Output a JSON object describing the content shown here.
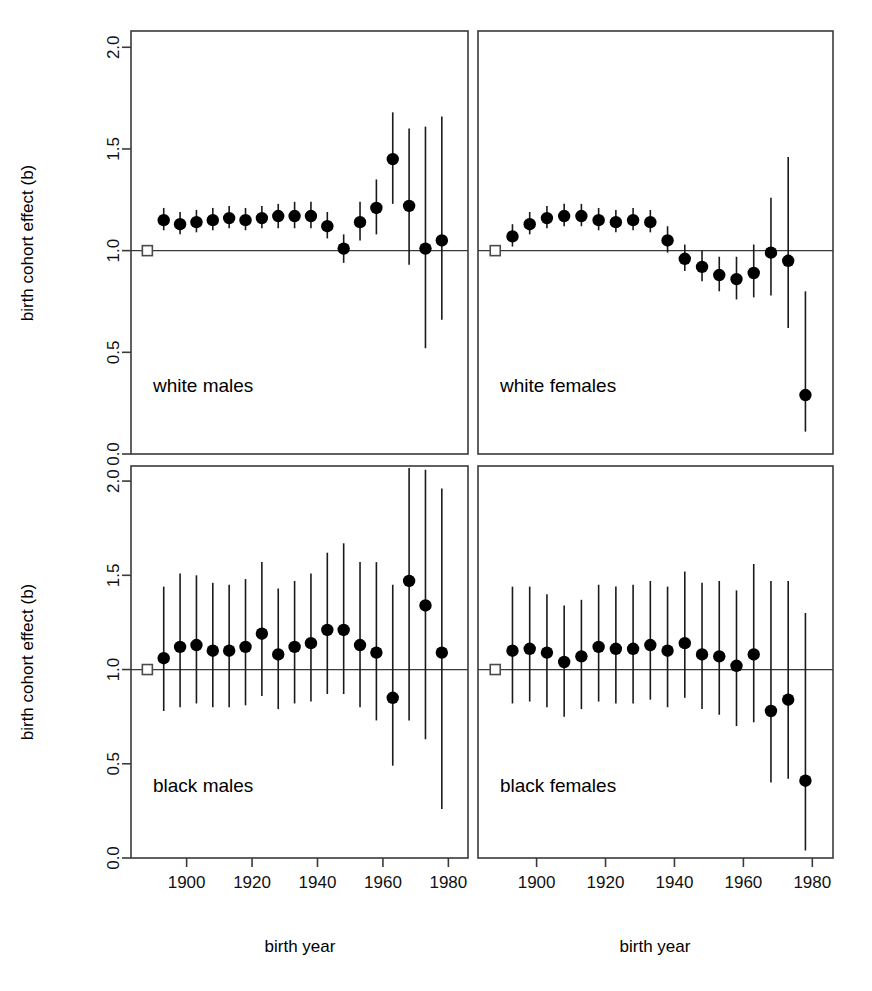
{
  "figure": {
    "title": "",
    "x_axis_label": "birth year",
    "y_axis_label": "birth cohort effect (b)",
    "y_ticks": [
      "0.0",
      "0.5",
      "1.0",
      "1.5",
      "2.0"
    ],
    "x_ticks": [
      "1900",
      "1920",
      "1940",
      "1960",
      "1980"
    ],
    "reference_value": "1.0",
    "reference_marker": "open-square",
    "point_marker": "filled-circle",
    "interval_marker": "vertical-error-bar"
  },
  "chart_data": {
    "type": "scatter",
    "title": "",
    "xlabel": "birth year",
    "ylabel": "birth cohort effect (b)",
    "xlim": [
      1883,
      1986
    ],
    "ylim": [
      0.0,
      2.08
    ],
    "yticks": [
      0.0,
      0.5,
      1.0,
      1.5,
      2.0
    ],
    "xticks": [
      1900,
      1920,
      1940,
      1960,
      1980
    ],
    "grid": false,
    "legend": "none",
    "reference_line_y": 1.0,
    "reference_point": {
      "x": 1888,
      "y": 1.0,
      "marker": "open square"
    },
    "panels": [
      {
        "name": "white males",
        "row": 0,
        "col": 0,
        "x": [
          1893,
          1898,
          1903,
          1908,
          1913,
          1918,
          1923,
          1928,
          1933,
          1938,
          1943,
          1948,
          1953,
          1958,
          1963,
          1968,
          1973,
          1978
        ],
        "y": [
          1.15,
          1.13,
          1.14,
          1.15,
          1.16,
          1.15,
          1.16,
          1.17,
          1.17,
          1.17,
          1.12,
          1.01,
          1.14,
          1.21,
          1.45,
          1.22,
          1.01,
          1.05
        ],
        "lo": [
          1.1,
          1.08,
          1.09,
          1.1,
          1.11,
          1.1,
          1.11,
          1.11,
          1.11,
          1.11,
          1.06,
          0.94,
          1.05,
          1.08,
          1.23,
          0.93,
          0.52,
          0.66
        ],
        "hi": [
          1.21,
          1.19,
          1.2,
          1.21,
          1.22,
          1.21,
          1.22,
          1.23,
          1.24,
          1.24,
          1.19,
          1.08,
          1.24,
          1.35,
          1.68,
          1.6,
          1.61,
          1.66
        ]
      },
      {
        "name": "white females",
        "row": 0,
        "col": 1,
        "x": [
          1893,
          1898,
          1903,
          1908,
          1913,
          1918,
          1923,
          1928,
          1933,
          1938,
          1943,
          1948,
          1953,
          1958,
          1963,
          1968,
          1973,
          1978
        ],
        "y": [
          1.07,
          1.13,
          1.16,
          1.17,
          1.17,
          1.15,
          1.14,
          1.15,
          1.14,
          1.05,
          0.96,
          0.92,
          0.88,
          0.86,
          0.89,
          0.99,
          0.95,
          0.29
        ],
        "lo": [
          1.02,
          1.08,
          1.11,
          1.12,
          1.12,
          1.1,
          1.09,
          1.1,
          1.09,
          0.99,
          0.9,
          0.85,
          0.8,
          0.76,
          0.77,
          0.78,
          0.62,
          0.11
        ],
        "hi": [
          1.13,
          1.19,
          1.22,
          1.23,
          1.23,
          1.21,
          1.2,
          1.21,
          1.2,
          1.12,
          1.03,
          1.0,
          0.97,
          0.97,
          1.03,
          1.26,
          1.46,
          0.8
        ]
      },
      {
        "name": "black males",
        "row": 1,
        "col": 0,
        "x": [
          1893,
          1898,
          1903,
          1908,
          1913,
          1918,
          1923,
          1928,
          1933,
          1938,
          1943,
          1948,
          1953,
          1958,
          1963,
          1968,
          1973,
          1978
        ],
        "y": [
          1.06,
          1.12,
          1.13,
          1.1,
          1.1,
          1.12,
          1.19,
          1.08,
          1.12,
          1.14,
          1.21,
          1.21,
          1.13,
          1.09,
          0.85,
          1.47,
          1.34,
          1.09
        ],
        "lo": [
          0.78,
          0.8,
          0.82,
          0.8,
          0.8,
          0.81,
          0.86,
          0.79,
          0.82,
          0.83,
          0.87,
          0.87,
          0.8,
          0.73,
          0.49,
          0.73,
          0.63,
          0.26
        ],
        "hi": [
          1.44,
          1.51,
          1.5,
          1.46,
          1.45,
          1.48,
          1.57,
          1.43,
          1.47,
          1.51,
          1.62,
          1.67,
          1.57,
          1.57,
          1.45,
          2.07,
          2.06,
          1.96
        ]
      },
      {
        "name": "black females",
        "row": 1,
        "col": 1,
        "x": [
          1893,
          1898,
          1903,
          1908,
          1913,
          1918,
          1923,
          1928,
          1933,
          1938,
          1943,
          1948,
          1953,
          1958,
          1963,
          1968,
          1973,
          1978
        ],
        "y": [
          1.1,
          1.11,
          1.09,
          1.04,
          1.07,
          1.12,
          1.11,
          1.11,
          1.13,
          1.1,
          1.14,
          1.08,
          1.07,
          1.02,
          1.08,
          0.78,
          0.84,
          0.41
        ],
        "lo": [
          0.82,
          0.83,
          0.8,
          0.75,
          0.79,
          0.83,
          0.82,
          0.82,
          0.84,
          0.8,
          0.85,
          0.79,
          0.76,
          0.7,
          0.72,
          0.4,
          0.42,
          0.04
        ],
        "hi": [
          1.44,
          1.44,
          1.4,
          1.34,
          1.37,
          1.45,
          1.44,
          1.45,
          1.47,
          1.44,
          1.52,
          1.46,
          1.47,
          1.42,
          1.56,
          1.47,
          1.47,
          1.3
        ]
      }
    ]
  }
}
